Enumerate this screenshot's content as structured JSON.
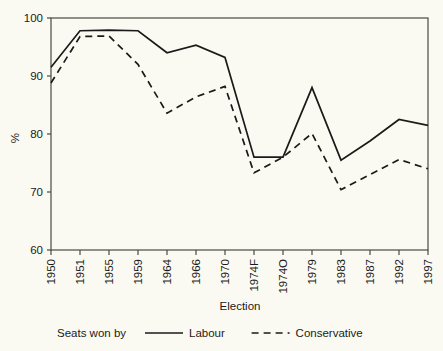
{
  "chart_data": {
    "type": "line",
    "title": "",
    "xlabel": "Election",
    "ylabel": "%",
    "categories": [
      "1950",
      "1951",
      "1955",
      "1959",
      "1964",
      "1966",
      "1970",
      "1974F",
      "1974O",
      "1979",
      "1983",
      "1987",
      "1992",
      "1997"
    ],
    "ylim": [
      60,
      100
    ],
    "yticks": [
      60,
      70,
      80,
      90,
      100
    ],
    "ytick_labels": [
      "60",
      "70",
      "80",
      "90",
      "100"
    ],
    "grid": false,
    "legend_position": "below-axis",
    "legend_prefix": "Seats won by",
    "series": [
      {
        "name": "Labour",
        "style": "solid",
        "color": "#1a1a1a",
        "values": [
          91.5,
          97.8,
          97.9,
          97.8,
          94.0,
          95.3,
          93.2,
          76.0,
          76.0,
          88.0,
          75.5,
          78.8,
          82.5,
          81.5
        ]
      },
      {
        "name": "Conservative",
        "style": "dashed",
        "color": "#1a1a1a",
        "values": [
          88.8,
          96.8,
          96.9,
          92.0,
          83.6,
          86.4,
          88.2,
          73.3,
          76.0,
          80.1,
          70.4,
          73.0,
          75.6,
          74.0
        ]
      }
    ]
  },
  "legend": {
    "prefix": "Seats won by",
    "items": [
      {
        "label": "Labour",
        "style": "solid"
      },
      {
        "label": "Conservative",
        "style": "dashed"
      }
    ]
  },
  "axes": {
    "x_title": "Election",
    "y_title": "%"
  }
}
